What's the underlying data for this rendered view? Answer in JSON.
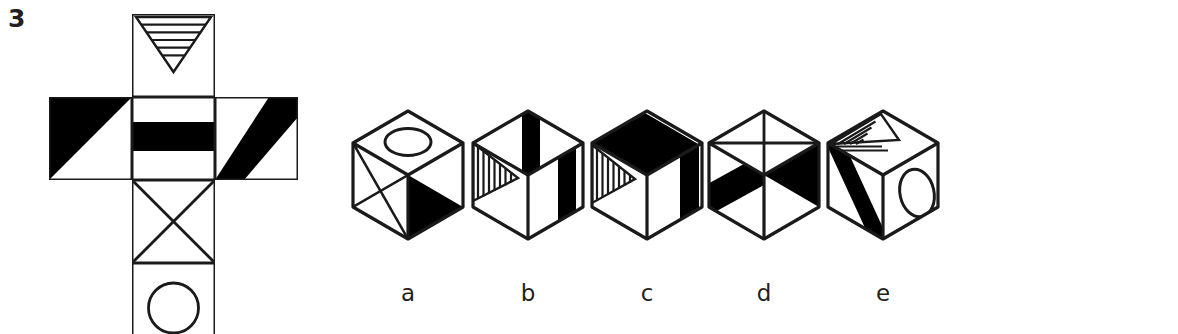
{
  "question": {
    "number": "3",
    "type": "cube-folding-spatial-reasoning"
  },
  "net": {
    "name": "cube-net",
    "description": "Cross-shaped unfolded cube net with six square faces",
    "origin": {
      "x": 9,
      "y": 14
    },
    "cell": 83,
    "grid": [
      {
        "col": 1,
        "row": 0,
        "face": "striped-down-triangle"
      },
      {
        "col": 0,
        "row": 1,
        "face": "black-upper-left-triangle"
      },
      {
        "col": 1,
        "row": 1,
        "face": "horizontal-black-band"
      },
      {
        "col": 2,
        "row": 1,
        "face": "diagonal-black-band"
      },
      {
        "col": 1,
        "row": 2,
        "face": "x-cross"
      },
      {
        "col": 1,
        "row": 3,
        "face": "circle"
      }
    ],
    "stripe_count": 5
  },
  "options": [
    {
      "id": "a",
      "label": "a",
      "center_x": 68,
      "top_face": "circle",
      "left_face": "x-cross",
      "right_face": "black-lower-left-triangle"
    },
    {
      "id": "b",
      "label": "b",
      "center_x": 188,
      "top_face": "black-band",
      "left_face": "striped-triangle",
      "right_face": "black-vertical-band"
    },
    {
      "id": "c",
      "label": "c",
      "center_x": 307,
      "top_face": "black-band-back-left",
      "left_face": "striped-triangle",
      "right_face": "black-vertical-band"
    },
    {
      "id": "d",
      "label": "d",
      "center_x": 424,
      "top_face": "x-cross",
      "left_face": "diagonal-black-band",
      "right_face": "black-triangle"
    },
    {
      "id": "e",
      "label": "e",
      "center_x": 543,
      "top_face": "striped-triangle",
      "left_face": "diagonal-black-band",
      "right_face": "circle",
      "clipped": true
    }
  ],
  "colors": {
    "ink": "#1a1a1a",
    "fill_black": "#000000",
    "background": "#ffffff",
    "text": "#231f20"
  },
  "stroke": {
    "net_outline": 3,
    "cube_outline": 3.2,
    "detail": 2.4
  }
}
